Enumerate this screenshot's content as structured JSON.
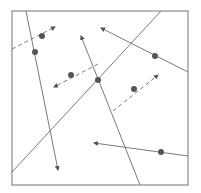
{
  "diagram": {
    "frame": {
      "x1": 12,
      "y1": 11,
      "x2": 188,
      "y2": 185,
      "color": "#8a8a8a"
    },
    "stroke_color": "#7a7a7a",
    "marker_color": "#555555",
    "lines": [
      {
        "id": "line-a",
        "x1": 26,
        "y1": 11,
        "x2": 58,
        "y2": 170,
        "style": "solid",
        "arrow_end": true
      },
      {
        "id": "line-b",
        "x1": 12,
        "y1": 49,
        "x2": 55,
        "y2": 27,
        "style": "dashed",
        "arrow_end": true
      },
      {
        "id": "line-c",
        "x1": 12,
        "y1": 172,
        "x2": 161,
        "y2": 11,
        "style": "solid",
        "arrow_end": false
      },
      {
        "id": "line-d",
        "x1": 188,
        "y1": 72,
        "x2": 101,
        "y2": 28,
        "style": "solid",
        "arrow_end": true
      },
      {
        "id": "line-e",
        "x1": 98,
        "y1": 64,
        "x2": 54,
        "y2": 87,
        "style": "dashed",
        "arrow_end": true
      },
      {
        "id": "line-f",
        "x1": 140,
        "y1": 185,
        "x2": 81,
        "y2": 36,
        "style": "solid",
        "arrow_end": true
      },
      {
        "id": "line-g",
        "x1": 113,
        "y1": 111,
        "x2": 158,
        "y2": 75,
        "style": "dashed",
        "arrow_end": true
      },
      {
        "id": "line-h",
        "x1": 188,
        "y1": 156,
        "x2": 94,
        "y2": 143,
        "style": "solid",
        "arrow_end": true
      }
    ],
    "dots": [
      {
        "id": "dot-1",
        "cx": 42,
        "cy": 36
      },
      {
        "id": "dot-2",
        "cx": 35,
        "cy": 52
      },
      {
        "id": "dot-3",
        "cx": 71,
        "cy": 75
      },
      {
        "id": "dot-4",
        "cx": 98,
        "cy": 80
      },
      {
        "id": "dot-5",
        "cx": 155,
        "cy": 56
      },
      {
        "id": "dot-6",
        "cx": 134,
        "cy": 89
      },
      {
        "id": "dot-7",
        "cx": 161,
        "cy": 152
      }
    ]
  }
}
